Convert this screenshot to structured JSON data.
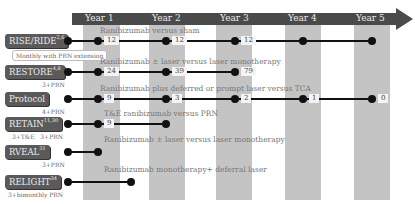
{
  "timeline": {
    "years": [
      "Year 1",
      "Year 2",
      "Year 3",
      "Year 4",
      "Year 5"
    ],
    "colors": {
      "arrow": "#4a4a4a",
      "band": "#c4c4c4",
      "label_bg": "#5a5a5a",
      "line": "#111111"
    }
  },
  "trials": [
    {
      "name": "RISE/RIDE",
      "ref": "2,6",
      "regimen": "Monthly with PRN extension",
      "description": "Ranibizumab versus sham",
      "values": [
        "12",
        "12",
        "12"
      ],
      "end": "Year 5"
    },
    {
      "name": "RESTORE",
      "ref": "4,8",
      "regimen": "3+PRN",
      "description": "Ranibizumab ± laser versus laser monotherapy",
      "values": [
        "24",
        "39",
        "79"
      ],
      "end": "Year 3"
    },
    {
      "name": "Protocol",
      "ref": "",
      "regimen": "4+PRN",
      "description": "Ranibizumab plus deferred or prompt laser versus TCA",
      "values": [
        "9",
        "3",
        "2",
        "1",
        "0"
      ],
      "end": "Year 5"
    },
    {
      "name": "RETAIN",
      "ref": "11,30",
      "regimen": "3+T&E   3+PRN",
      "description": "T&E ranibizumab versus PRN",
      "values": [
        "9"
      ],
      "end": "Year 2"
    },
    {
      "name": "RVEAL",
      "ref": "31",
      "regimen": "3+PRN",
      "description": "Ranibizumab ± laser versus laser monotherapy",
      "values": [],
      "end": "Year 1"
    },
    {
      "name": "RELIGHT",
      "ref": "34",
      "regimen": "3+bimonthly PRN",
      "description": "Ranibizumab monotherapy+ deferral  laser",
      "values": [],
      "end": "Year 1.5"
    }
  ]
}
